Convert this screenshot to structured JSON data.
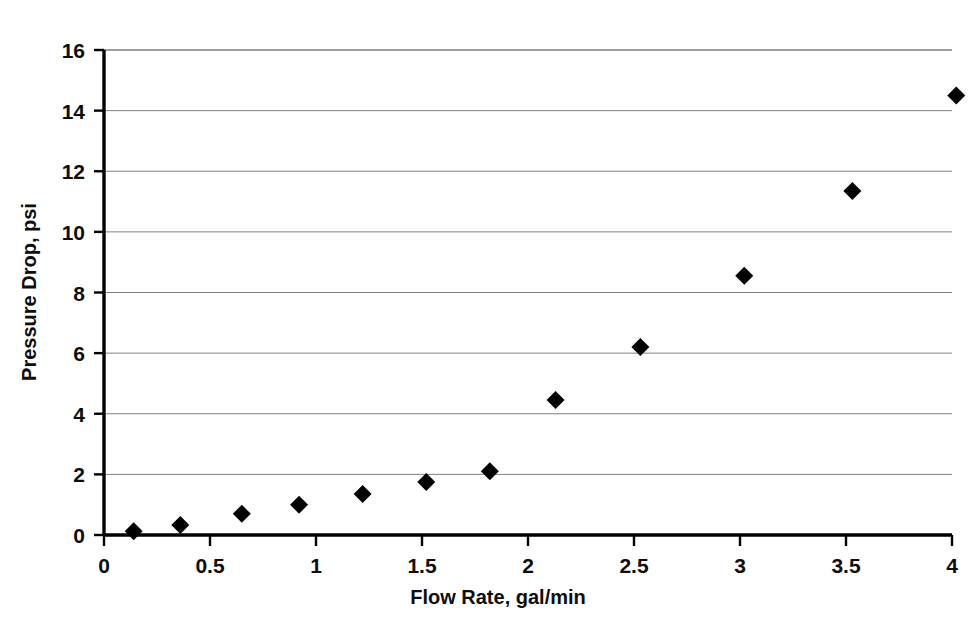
{
  "chart_data": {
    "type": "scatter",
    "title": "",
    "xlabel": "Flow Rate, gal/min",
    "ylabel": "Pressure Drop, psi",
    "xlim": [
      0,
      4
    ],
    "ylim": [
      0,
      16
    ],
    "xticks": [
      "0",
      "0.5",
      "1",
      "1.5",
      "2",
      "2.5",
      "3",
      "3.5",
      "4"
    ],
    "xtick_values": [
      0,
      0.5,
      1,
      1.5,
      2,
      2.5,
      3,
      3.5,
      4
    ],
    "yticks": [
      "0",
      "2",
      "4",
      "6",
      "8",
      "10",
      "12",
      "14",
      "16"
    ],
    "ytick_values": [
      0,
      2,
      4,
      6,
      8,
      10,
      12,
      14,
      16
    ],
    "grid": "horizontal",
    "grid_color": "#808080",
    "axis_color": "#000000",
    "marker": "diamond",
    "marker_color": "#000000",
    "marker_size": 9,
    "legend": "none",
    "series": [
      {
        "name": "Pressure Drop vs Flow Rate",
        "points": [
          {
            "x": 0.14,
            "y": 0.12
          },
          {
            "x": 0.36,
            "y": 0.33
          },
          {
            "x": 0.65,
            "y": 0.7
          },
          {
            "x": 0.92,
            "y": 1.0
          },
          {
            "x": 1.22,
            "y": 1.35
          },
          {
            "x": 1.52,
            "y": 1.75
          },
          {
            "x": 1.82,
            "y": 2.1
          },
          {
            "x": 2.13,
            "y": 4.45
          },
          {
            "x": 2.53,
            "y": 6.2
          },
          {
            "x": 3.02,
            "y": 8.55
          },
          {
            "x": 3.53,
            "y": 11.35
          },
          {
            "x": 4.02,
            "y": 14.5
          }
        ]
      }
    ]
  }
}
